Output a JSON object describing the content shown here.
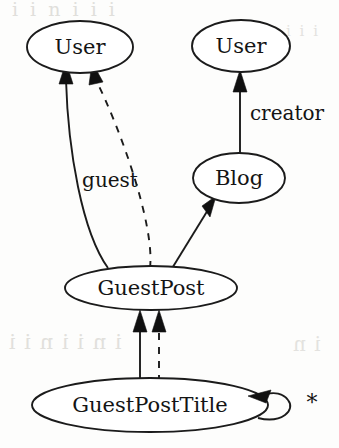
{
  "diagram": {
    "type": "entity-relationship-graph",
    "width": 339,
    "height": 448,
    "background_color": "#fdfdfc",
    "stroke_color": "#1b1b1b",
    "text_color": "#141414",
    "nodes": [
      {
        "id": "user-left",
        "label": "User",
        "shape": "ellipse",
        "cx": 80,
        "cy": 47,
        "rx": 53,
        "ry": 26,
        "font_size": 21
      },
      {
        "id": "user-right",
        "label": "User",
        "shape": "ellipse",
        "cx": 241,
        "cy": 46,
        "rx": 49,
        "ry": 26,
        "font_size": 21
      },
      {
        "id": "blog",
        "label": "Blog",
        "shape": "ellipse",
        "cx": 239,
        "cy": 178,
        "rx": 46,
        "ry": 25,
        "font_size": 21
      },
      {
        "id": "guestpost",
        "label": "GuestPost",
        "shape": "ellipse",
        "cx": 151,
        "cy": 288,
        "rx": 86,
        "ry": 22,
        "font_size": 21
      },
      {
        "id": "guestposttitle",
        "label": "GuestPostTitle",
        "shape": "ellipse",
        "cx": 150,
        "cy": 405,
        "rx": 118,
        "ry": 27,
        "font_size": 21
      }
    ],
    "edges": [
      {
        "id": "edge-guestpost-user-guest",
        "from": "guestpost",
        "to": "user-left",
        "style": "solid",
        "arrow": "filled-triangle",
        "label": "guest",
        "label_x": 110,
        "label_y": 181,
        "label_font_size": 20
      },
      {
        "id": "edge-guestpost-user-dashed",
        "from": "guestpost",
        "to": "user-left",
        "style": "dashed",
        "arrow": "filled-triangle",
        "label": ""
      },
      {
        "id": "edge-guestpost-blog",
        "from": "guestpost",
        "to": "blog",
        "style": "solid",
        "arrow": "filled-triangle",
        "label": ""
      },
      {
        "id": "edge-blog-user-creator",
        "from": "blog",
        "to": "user-right",
        "style": "solid",
        "arrow": "filled-triangle",
        "label": "creator",
        "label_x": 287,
        "label_y": 114,
        "label_font_size": 20
      },
      {
        "id": "edge-title-guestpost-solid",
        "from": "guestposttitle",
        "to": "guestpost",
        "style": "solid",
        "arrow": "filled-triangle",
        "label": ""
      },
      {
        "id": "edge-title-guestpost-dashed",
        "from": "guestposttitle",
        "to": "guestpost",
        "style": "dashed",
        "arrow": "filled-triangle",
        "label": ""
      },
      {
        "id": "edge-title-self-loop",
        "from": "guestposttitle",
        "to": "guestposttitle",
        "style": "solid",
        "arrow": "filled-triangle",
        "label": "*",
        "label_x": 312,
        "label_y": 404,
        "label_font_size": 22
      }
    ],
    "background_artifacts": {
      "top_line": "i i n  i  i  i",
      "top_right": "i i i",
      "mid_line": "i n i i n i i",
      "mid_right": "i n"
    }
  }
}
